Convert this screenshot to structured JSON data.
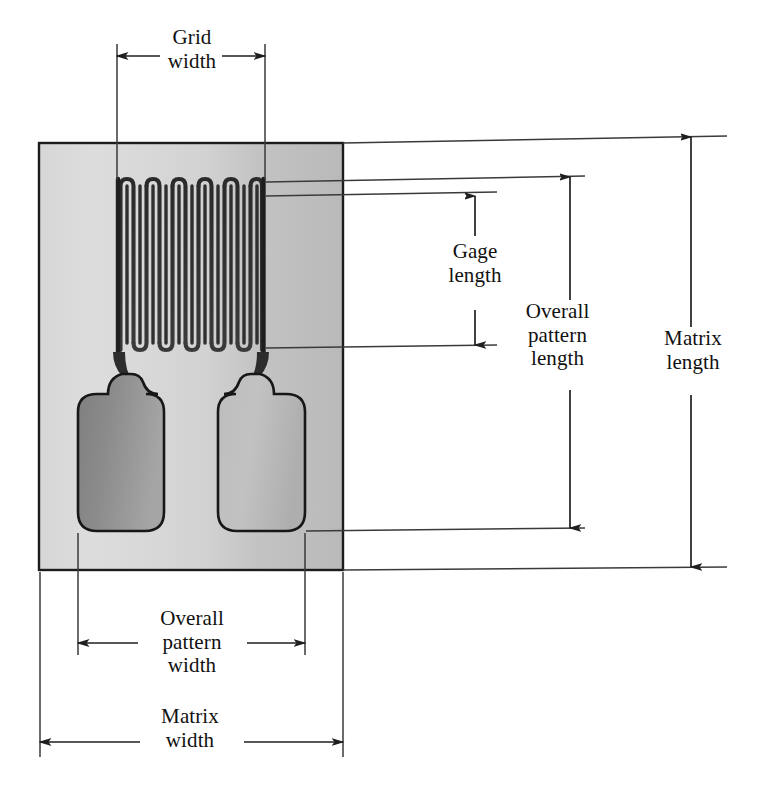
{
  "figure": {
    "dimensions": {
      "grid_width": "Grid\nwidth",
      "gage_length": "Gage\nlength",
      "overall_pattern_length": "Overall\npattern\nlength",
      "matrix_length": "Matrix\nlength",
      "overall_pattern_width": "Overall\npattern\nwidth",
      "matrix_width": "Matrix\nwidth"
    },
    "colors": {
      "background": "#ffffff",
      "matrix_light": "#dcdcdc",
      "matrix_mid": "#c9c9c9",
      "matrix_shadow": "#b0b0b0",
      "tab_left_dark": "#8d8d8d",
      "tab_left_light": "#a8a8a8",
      "tab_right_light": "#c4c4c4",
      "tab_right_mid": "#b3b3b3",
      "foil_outline": "#141414",
      "line": "#2b2b2b"
    },
    "geometry": {
      "matrix": {
        "x": 39,
        "y": 143,
        "width": 304,
        "height": 427
      },
      "grid": {
        "x": 117,
        "y": 178,
        "width": 148,
        "height": 172
      },
      "grid_traces": 20,
      "tab_left": {
        "x": 78,
        "y": 394,
        "width": 86,
        "height": 137
      },
      "tab_right": {
        "x": 218,
        "y": 394,
        "width": 87,
        "height": 137
      }
    }
  }
}
